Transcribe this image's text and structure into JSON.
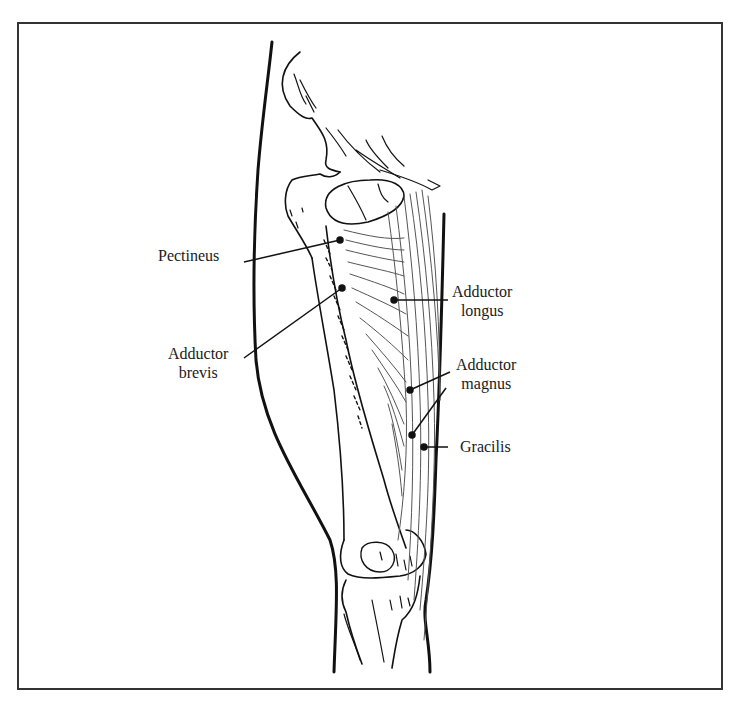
{
  "figure": {
    "frame_color": "#333333",
    "line_color": "#111111",
    "muscle_line_color": "#555555"
  },
  "labels": [
    {
      "id": "pectineus",
      "line1": "Pectineus",
      "line2": "",
      "x": 158,
      "y": 246,
      "align": "left",
      "leader": {
        "x1": 244,
        "y1": 262,
        "x2": 340,
        "y2": 240
      }
    },
    {
      "id": "adductor-brevis",
      "line1": "Adductor",
      "line2": "brevis",
      "x": 168,
      "y": 344,
      "align": "center",
      "leader": {
        "x1": 244,
        "y1": 358,
        "x2": 342,
        "y2": 288
      }
    },
    {
      "id": "adductor-longus",
      "line1": "Adductor",
      "line2": "longus",
      "x": 452,
      "y": 282,
      "align": "left",
      "leader": {
        "x1": 448,
        "y1": 300,
        "x2": 394,
        "y2": 300
      }
    },
    {
      "id": "adductor-magnus",
      "line1": "Adductor",
      "line2": "magnus",
      "x": 456,
      "y": 355,
      "align": "left",
      "leader": {
        "x1": 450,
        "y1": 372,
        "x2": 410,
        "y2": 390
      }
    },
    {
      "id": "gracilis",
      "line1": "Gracilis",
      "line2": "",
      "x": 460,
      "y": 437,
      "align": "left",
      "leader": {
        "x1": 448,
        "y1": 447,
        "x2": 424,
        "y2": 447
      }
    }
  ],
  "extra_leaders": [
    {
      "for": "gracilis-second-pointer",
      "x1": 446,
      "y1": 388,
      "x2": 412,
      "y2": 435
    }
  ]
}
